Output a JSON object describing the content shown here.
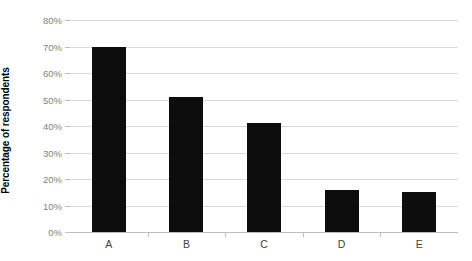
{
  "chart_data": {
    "type": "bar",
    "title": "",
    "subtitle": "",
    "xlabel": "",
    "ylabel": "Percentage of respondents",
    "categories": [
      "A",
      "B",
      "C",
      "D",
      "E"
    ],
    "values": [
      70,
      51,
      41,
      16,
      15
    ],
    "value_labels": [
      "70%",
      "51%",
      "41%",
      "16%",
      "15%"
    ],
    "ylim": [
      0,
      80
    ],
    "ytick_values": [
      0,
      10,
      20,
      30,
      40,
      50,
      60,
      70,
      80
    ],
    "ytick_labels": [
      "0%",
      "10%",
      "20%",
      "30%",
      "40%",
      "50%",
      "60%",
      "70%",
      "80%"
    ],
    "grid": true,
    "legend": null,
    "legend_position": "none",
    "series": [
      {
        "name": "Percentage of respondents",
        "values": [
          70,
          51,
          41,
          16,
          15
        ],
        "color": "#0d0d0d"
      }
    ],
    "colors": {
      "bar": "#0d0d0d",
      "gridline": "#d9d9d9",
      "axis": "#bfbfbf",
      "tick_label": "#808080",
      "category_label": "#3f3f3f",
      "axis_title": "#000000",
      "background": "#ffffff"
    }
  }
}
